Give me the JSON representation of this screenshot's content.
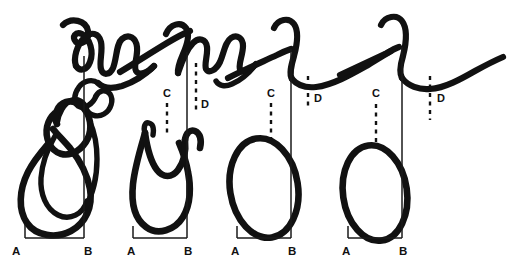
{
  "figure": {
    "kind": "hand-drawn-line-diagram",
    "width": 515,
    "height": 264,
    "background_color": "#ffffff",
    "ink_color": "#111111",
    "panel_count": 4
  },
  "panels": [
    {
      "id": "panel-1",
      "baseline_label_left": "A",
      "baseline_label_right": "B",
      "has_marker_c": false,
      "has_marker_d": false,
      "marker_c_label": "",
      "marker_d_label": "",
      "upper_trace_shape": "sharp jagged spiked crest",
      "lower_trace_shape": "elongated tilted loop with inner loop"
    },
    {
      "id": "panel-2",
      "baseline_label_left": "A",
      "baseline_label_right": "B",
      "has_marker_c": true,
      "has_marker_d": true,
      "marker_c_label": "C",
      "marker_d_label": "D",
      "upper_trace_shape": "rising slope with small zigzag crest",
      "lower_trace_shape": "U loop with inner notch"
    },
    {
      "id": "panel-3",
      "baseline_label_left": "A",
      "baseline_label_right": "B",
      "has_marker_c": true,
      "has_marker_d": true,
      "marker_c_label": "C",
      "marker_d_label": "D",
      "upper_trace_shape": "single rounded hook with shallow trough",
      "lower_trace_shape": "closed oval"
    },
    {
      "id": "panel-4",
      "baseline_label_left": "A",
      "baseline_label_right": "B",
      "has_marker_c": true,
      "has_marker_d": true,
      "marker_c_label": "C",
      "marker_d_label": "D",
      "upper_trace_shape": "smooth rounded hook with broad shallow trough",
      "lower_trace_shape": "closed oval"
    }
  ],
  "labels": {
    "a1": "A",
    "b1": "B",
    "a2": "A",
    "b2": "B",
    "c2": "C",
    "d2": "D",
    "a3": "A",
    "b3": "B",
    "c3": "C",
    "d3": "D",
    "a4": "A",
    "b4": "B",
    "c4": "C",
    "d4": "D"
  }
}
